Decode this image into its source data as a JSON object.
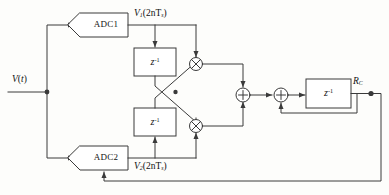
{
  "figure": {
    "type": "block-diagram",
    "title": ""
  },
  "signals": {
    "input_label": "V(t)",
    "input_var": "V",
    "input_arg": "t",
    "adc1_output_var": "V",
    "adc1_output_sub": "1",
    "adc1_output_arg": "(2nT",
    "adc1_output_arg_sub": "s",
    "adc1_output_arg_end": ")",
    "adc2_output_var": "V",
    "adc2_output_sub": "2",
    "adc2_output_arg": "(2nT",
    "adc2_output_arg_sub": "s",
    "adc2_output_arg_end": ")",
    "output_var": "R",
    "output_sub": "C"
  },
  "blocks": {
    "adc1": {
      "label": "ADC1",
      "shape": "hexagon"
    },
    "adc2": {
      "label": "ADC2",
      "shape": "hexagon"
    },
    "delay_top": {
      "label": "z",
      "exponent": "-1",
      "shape": "rect"
    },
    "delay_bottom": {
      "label": "z",
      "exponent": "-1",
      "shape": "rect"
    },
    "delay_out": {
      "label": "z",
      "exponent": "-1",
      "shape": "rect"
    }
  },
  "operators": {
    "mult_top": {
      "symbol": "×",
      "kind": "multiplier"
    },
    "mult_bottom": {
      "symbol": "×",
      "kind": "multiplier"
    },
    "adder_1": {
      "symbol": "+",
      "kind": "adder"
    },
    "adder_2": {
      "symbol": "+",
      "kind": "adder"
    }
  },
  "colors": {
    "line": "#3a3a3a",
    "text": "#111111",
    "background": "#fdfdfb",
    "block_fill": "#ffffff"
  }
}
